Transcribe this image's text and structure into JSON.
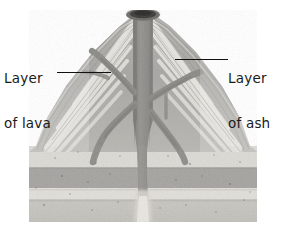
{
  "figure": {
    "type": "cutaway-diagram",
    "media": "grayscale-photograph"
  },
  "labels": {
    "lava": {
      "line1": "Layer",
      "line2": "of lava",
      "leader": "leader-line-left",
      "points_to": "light diagonal lava band on left flank"
    },
    "ash": {
      "line1": "Layer",
      "line2": "of ash",
      "leader": "leader-line-right",
      "points_to": "gray ash band on right flank"
    }
  },
  "parts": [
    {
      "name": "summit-crater",
      "description": "dark oval opening at the peak"
    },
    {
      "name": "central-vent",
      "description": "vertical dark gray conduit from crater to base"
    },
    {
      "name": "dike-left-upper",
      "description": "branch angling up-left from vent"
    },
    {
      "name": "dike-left-lower",
      "description": "branch angling down-left from vent"
    },
    {
      "name": "dike-right-upper",
      "description": "branch angling up-right from vent"
    },
    {
      "name": "dike-right-lower",
      "description": "branch angling down-right from vent"
    },
    {
      "name": "cone-flanks",
      "description": "alternating light lava and dark ash layers"
    },
    {
      "name": "bedrock-strata",
      "description": "horizontal sedimentary rock bands below cone"
    }
  ],
  "colors": {
    "background": "#ffffff",
    "label_text": "#1a1a1a",
    "leader_line": "#111111",
    "ash_layer": "#a9a8a4",
    "lava_layer": "#e2e1dc",
    "vent_fill": "#8e8d89",
    "crater": "#3c3b39",
    "strata_light": "#dedcd6",
    "strata_dark": "#a3a29e",
    "strata_base": "#c6c4be"
  },
  "strata": [
    {
      "name": "upper-light-band",
      "tone": "light"
    },
    {
      "name": "dark-gray-band",
      "tone": "dark"
    },
    {
      "name": "lower-light-band",
      "tone": "light"
    },
    {
      "name": "basal-band",
      "tone": "medium"
    }
  ]
}
